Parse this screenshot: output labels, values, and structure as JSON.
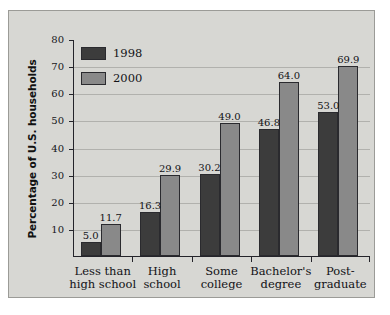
{
  "chart_data": {
    "type": "bar",
    "title": "",
    "xlabel": "",
    "ylabel": "Percentage of U.S. households",
    "ylim": [
      0,
      80
    ],
    "ytick_labels": [
      "80",
      "70",
      "60",
      "50",
      "40",
      "30",
      "20",
      "10"
    ],
    "ytick_values": [
      80,
      70,
      60,
      50,
      40,
      30,
      20,
      10
    ],
    "grid": true,
    "legend_position": "upper-left-inside",
    "categories": [
      "Less than\nhigh school",
      "High\nschool",
      "Some\ncollege",
      "Bachelor's\ndegree",
      "Post-\ngraduate"
    ],
    "category_lines": [
      [
        "Less than",
        "high school"
      ],
      [
        "High",
        "school"
      ],
      [
        "Some",
        "college"
      ],
      [
        "Bachelor's",
        "degree"
      ],
      [
        "Post-",
        "graduate"
      ]
    ],
    "series": [
      {
        "name": "1998",
        "color": "#3c3c3c",
        "values": [
          5.0,
          16.3,
          30.2,
          46.8,
          53.0
        ],
        "labels": [
          "5.0",
          "16.3",
          "30.2",
          "46.8",
          "53.0"
        ]
      },
      {
        "name": "2000",
        "color": "#898989",
        "values": [
          11.7,
          29.9,
          49.0,
          64.0,
          69.9
        ],
        "labels": [
          "11.7",
          "29.9",
          "49.0",
          "64.0",
          "69.9"
        ]
      }
    ]
  },
  "figure": {
    "background_color": "#d7d7d3",
    "border_color": "#9b9b97",
    "axis_color": "#24242a",
    "gridline_color": "#b1b1ad"
  }
}
